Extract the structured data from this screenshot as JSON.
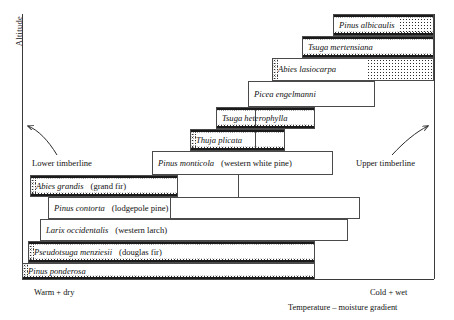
{
  "axes": {
    "y_label": "Altitude",
    "x_left_label": "Warm + dry",
    "x_right_label": "Cold + wet",
    "x_title": "Temperature – moisture gradient"
  },
  "annotations": {
    "lower_timberline": "Lower timberline",
    "upper_timberline": "Upper timberline"
  },
  "chart_data": {
    "type": "bar",
    "title": "",
    "xlabel": "Temperature – moisture gradient",
    "ylabel": "Altitude",
    "orientation": "horizontal-ranges",
    "categories": [
      "Pinus albicaulis",
      "Tsuga mertensiana",
      "Abies lasiocarpa",
      "Picea engelmanni",
      "Tsuga heterophylla",
      "Thuja plicata",
      "Pinus monticola",
      "Abies grandis",
      "Pinus contorta",
      "Larix occidentalis",
      "Pseudotsuga menziesii",
      "Pinus ponderosa"
    ],
    "series": [
      {
        "name": "species range",
        "items": [
          {
            "sci": "Pinus albicaulis",
            "common": "",
            "x_start": 333,
            "x_end": 434,
            "y": 14,
            "height": 22,
            "rank": 12
          },
          {
            "sci": "Tsuga mertensiana",
            "common": "",
            "x_start": 302,
            "x_end": 434,
            "y": 36,
            "height": 22,
            "rank": 11
          },
          {
            "sci": "Abies lasiocarpa",
            "common": "",
            "x_start": 272,
            "x_end": 434,
            "y": 58,
            "height": 23,
            "rank": 10
          },
          {
            "sci": "Picea engelmanni",
            "common": "",
            "x_start": 248,
            "x_end": 375,
            "y": 81,
            "height": 26,
            "rank": 9
          },
          {
            "sci": "Tsuga heterophylla",
            "common": "",
            "x_start": 216,
            "x_end": 315,
            "y": 107,
            "height": 22,
            "rank": 8
          },
          {
            "sci": "Thuja plicata",
            "common": "",
            "x_start": 190,
            "x_end": 285,
            "y": 129,
            "height": 22,
            "rank": 7
          },
          {
            "sci": "Pinus monticola",
            "common": "(western white pine)",
            "x_start": 152,
            "x_end": 333,
            "y": 151,
            "height": 24,
            "rank": 6
          },
          {
            "sci": "Abies grandis",
            "common": "(grand fir)",
            "x_start": 30,
            "x_end": 178,
            "y": 175,
            "height": 22,
            "rank": 5
          },
          {
            "sci": "Pinus contorta",
            "common": "(lodgepole pine)",
            "x_start": 48,
            "x_end": 360,
            "y": 197,
            "height": 22,
            "rank": 4
          },
          {
            "sci": "Larix occidentalis",
            "common": "(western larch)",
            "x_start": 40,
            "x_end": 348,
            "y": 219,
            "height": 22,
            "rank": 3
          },
          {
            "sci": "Pseudotsuga menziesii",
            "common": "(douglas fir)",
            "x_start": 28,
            "x_end": 315,
            "y": 241,
            "height": 22,
            "rank": 2
          },
          {
            "sci": "Pinus ponderosa",
            "common": "",
            "x_start": 22,
            "x_end": 315,
            "y": 263,
            "height": 17,
            "rank": 1
          }
        ]
      }
    ]
  }
}
